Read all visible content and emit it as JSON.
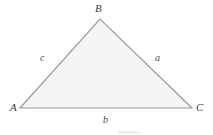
{
  "figure": {
    "kind": "triangle-diagram",
    "background_color": "#ffffff",
    "fill_color": "#f5f5f5",
    "stroke_color": "#9a9a9a",
    "stroke_width": 1.2,
    "label_color": "#3d3d3d"
  },
  "chart_data": {
    "type": "diagram",
    "title": "",
    "shape": "triangle",
    "vertices": [
      {
        "name": "A",
        "x": 20,
        "y": 108
      },
      {
        "name": "B",
        "x": 100,
        "y": 19
      },
      {
        "name": "C",
        "x": 192,
        "y": 108
      }
    ],
    "sides": [
      {
        "name": "a",
        "between": [
          "B",
          "C"
        ],
        "label_x": 158,
        "label_y": 58
      },
      {
        "name": "b",
        "between": [
          "A",
          "C"
        ],
        "label_x": 106,
        "label_y": 120
      },
      {
        "name": "c",
        "between": [
          "A",
          "B"
        ],
        "label_x": 43,
        "label_y": 58
      }
    ]
  },
  "labels": {
    "vertex_A": "A",
    "vertex_B": "B",
    "vertex_C": "C",
    "side_a": "a",
    "side_b": "b",
    "side_c": "c"
  }
}
